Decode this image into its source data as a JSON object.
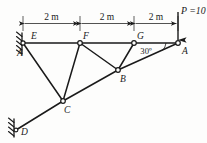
{
  "figure": {
    "type": "truss-free-body-diagram",
    "background_color": "#fdfdfc",
    "line_color": "#1a1a1a",
    "dimension_text": "2 m",
    "load_label": "P =10 kN",
    "angle_label": "30º"
  },
  "dimensions": [
    {
      "id": "dim1",
      "label": "2 m",
      "from": "E",
      "to": "F"
    },
    {
      "id": "dim2",
      "label": "2 m",
      "from": "F",
      "to": "G"
    },
    {
      "id": "dim3",
      "label": "2 m",
      "from": "G",
      "to": "A"
    }
  ],
  "nodes": [
    {
      "id": "E",
      "label": "E",
      "x": 23,
      "y": 43,
      "joint": false,
      "label_dx": 8,
      "label_dy": -4
    },
    {
      "id": "Aleft",
      "label": "A",
      "x": 23,
      "y": 43,
      "joint": false,
      "label_dx": -6,
      "label_dy": 13
    },
    {
      "id": "F",
      "label": "F",
      "x": 80,
      "y": 43,
      "joint": true,
      "label_dx": 3,
      "label_dy": -4
    },
    {
      "id": "G",
      "label": "G",
      "x": 134,
      "y": 43,
      "joint": true,
      "label_dx": 3,
      "label_dy": -4
    },
    {
      "id": "A",
      "label": "A",
      "x": 178,
      "y": 43,
      "joint": true,
      "label_dx": 4,
      "label_dy": 11
    },
    {
      "id": "B",
      "label": "B",
      "x": 118,
      "y": 70,
      "joint": true,
      "label_dx": 2,
      "label_dy": 12
    },
    {
      "id": "C",
      "label": "C",
      "x": 63,
      "y": 101,
      "joint": true,
      "label_dx": 1,
      "label_dy": 12
    },
    {
      "id": "D",
      "label": "D",
      "x": 16,
      "y": 130,
      "joint": false,
      "label_dx": 5,
      "label_dy": 5
    }
  ],
  "members": [
    {
      "id": "m-EF",
      "from": "E",
      "to": "F"
    },
    {
      "id": "m-FG",
      "from": "F",
      "to": "G"
    },
    {
      "id": "m-GA",
      "from": "G",
      "to": "A"
    },
    {
      "id": "m-AB",
      "from": "A",
      "to": "B"
    },
    {
      "id": "m-BC",
      "from": "B",
      "to": "C"
    },
    {
      "id": "m-CD",
      "from": "C",
      "to": "D"
    },
    {
      "id": "m-EC",
      "from": "E",
      "to": "C"
    },
    {
      "id": "m-FC",
      "from": "F",
      "to": "C"
    },
    {
      "id": "m-FB",
      "from": "F",
      "to": "B"
    },
    {
      "id": "m-GB",
      "from": "G",
      "to": "B"
    }
  ],
  "supports": [
    {
      "id": "support-A-left",
      "at": "E",
      "kind": "pin-hatched"
    },
    {
      "id": "support-D",
      "at": "D",
      "kind": "pin-hatched"
    }
  ],
  "load": {
    "id": "load-P",
    "label": "P =10 kN",
    "magnitude": 10,
    "unit": "kN",
    "symbol": "P",
    "direction": "down",
    "at_node": "A",
    "x": 178,
    "tail_y": 12,
    "head_y": 41
  },
  "angle": {
    "id": "angle-A",
    "label": "30º",
    "value": 30,
    "unit": "degrees",
    "at_node": "A",
    "label_x": 146,
    "label_y": 54
  }
}
